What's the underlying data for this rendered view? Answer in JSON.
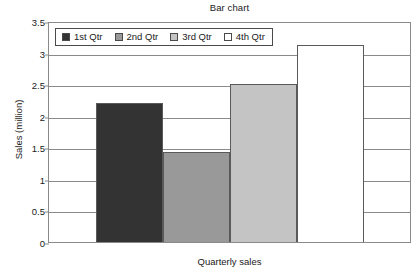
{
  "chart_data": {
    "type": "bar",
    "title": "Bar chart",
    "xlabel": "Quarterly sales",
    "ylabel": "Sales (million)",
    "categories": [
      "1st Qtr",
      "2nd Qtr",
      "3rd Qtr",
      "4th Qtr"
    ],
    "values": [
      2.2,
      1.42,
      2.5,
      3.12
    ],
    "ylim": [
      0,
      3.5
    ],
    "ytick_labels": [
      "3.5",
      "3",
      "2.5",
      "2",
      "1.5",
      "1",
      "0.5",
      "0"
    ],
    "ytick_values": [
      3.5,
      3,
      2.5,
      2,
      1.5,
      1,
      0.5,
      0
    ],
    "xtick_labels": [],
    "grid": true,
    "legend_position": "top-left",
    "series": [
      {
        "name": "Sales",
        "values": [
          2.2,
          1.42,
          2.5,
          3.12
        ]
      }
    ],
    "bar_colors": [
      "#333333",
      "#999999",
      "#c4c4c4",
      "#ffffff"
    ],
    "bar_edge_color": "#5a5a5a",
    "axis_color": "#8a8a8a",
    "background_color": "#ffffff",
    "text_color": "#1a1a1a"
  },
  "legend": {
    "entries": [
      {
        "label": "1st Qtr",
        "color": "#333333"
      },
      {
        "label": "2nd Qtr",
        "color": "#999999"
      },
      {
        "label": "3rd Qtr",
        "color": "#c4c4c4"
      },
      {
        "label": "4th Qtr",
        "color": "#ffffff"
      }
    ]
  }
}
